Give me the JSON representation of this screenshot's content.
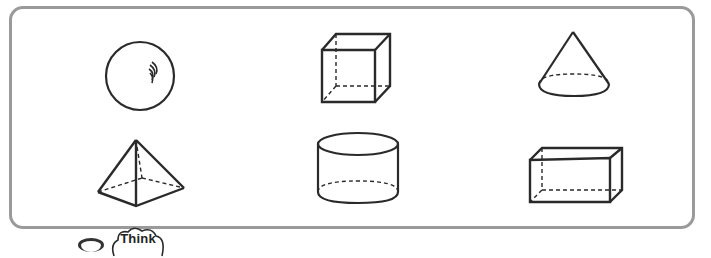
{
  "worksheet": {
    "frame_color": "#9a9a9a",
    "stroke_color": "#2a2a2a",
    "shapes": [
      {
        "name": "sphere",
        "row": 1,
        "col": 1
      },
      {
        "name": "cube",
        "row": 1,
        "col": 2
      },
      {
        "name": "cone",
        "row": 1,
        "col": 3
      },
      {
        "name": "square-pyramid",
        "row": 2,
        "col": 1
      },
      {
        "name": "cylinder",
        "row": 2,
        "col": 2
      },
      {
        "name": "rectangular-prism",
        "row": 2,
        "col": 3
      }
    ]
  },
  "badge": {
    "label": "Think"
  }
}
